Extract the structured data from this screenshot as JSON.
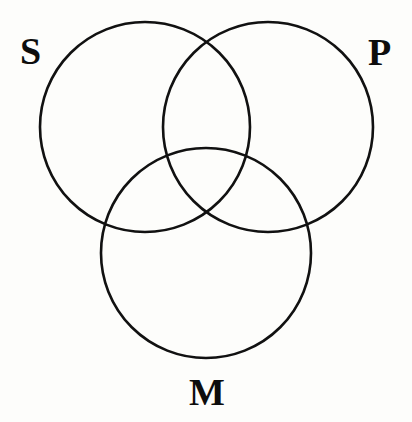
{
  "diagram": {
    "type": "venn-three-circle",
    "background_color": "#fdfdfb",
    "stroke_color": "#111111",
    "stroke_width": 2.6,
    "label_color": "#0d0d0d",
    "circles": [
      {
        "id": "S",
        "label": "S",
        "cx": 145,
        "cy": 127,
        "r": 105
      },
      {
        "id": "P",
        "label": "P",
        "cx": 268,
        "cy": 127,
        "r": 105
      },
      {
        "id": "M",
        "label": "M",
        "cx": 206,
        "cy": 253,
        "r": 105
      }
    ],
    "labels": {
      "subject": "S",
      "predicate": "P",
      "middle": "M"
    }
  }
}
